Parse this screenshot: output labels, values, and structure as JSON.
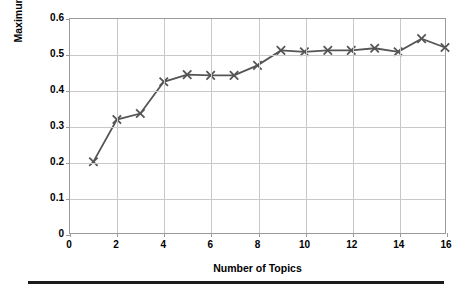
{
  "chart_data": {
    "type": "line",
    "title": "",
    "xlabel": "Number of Topics",
    "ylabel": "Maximum C_v Value",
    "x": [
      1,
      2,
      3,
      4,
      5,
      6,
      7,
      8,
      9,
      10,
      11,
      12,
      13,
      14,
      15,
      16
    ],
    "values": [
      0.2,
      0.318,
      0.335,
      0.424,
      0.444,
      0.442,
      0.442,
      0.47,
      0.512,
      0.508,
      0.512,
      0.512,
      0.518,
      0.508,
      0.545,
      0.52
    ],
    "series": [
      {
        "name": "Maximum C_v Value",
        "values": [
          0.2,
          0.318,
          0.335,
          0.424,
          0.444,
          0.442,
          0.442,
          0.47,
          0.512,
          0.508,
          0.512,
          0.512,
          0.518,
          0.508,
          0.545,
          0.52
        ]
      }
    ],
    "xlim": [
      0,
      16
    ],
    "ylim": [
      0,
      0.6
    ],
    "xticks": [
      "0",
      "2",
      "4",
      "6",
      "8",
      "10",
      "12",
      "14",
      "16"
    ],
    "xtick_values": [
      0,
      2,
      4,
      6,
      8,
      10,
      12,
      14,
      16
    ],
    "yticks": [
      "0",
      "0.1",
      "0.2",
      "0.3",
      "0.4",
      "0.5",
      "0.6"
    ],
    "ytick_values": [
      0,
      0.1,
      0.2,
      0.3,
      0.4,
      0.5,
      0.6
    ],
    "grid": true,
    "grid_axis": "both",
    "legend": null,
    "legend_position": "none",
    "marker": "x",
    "line_color": "#555555",
    "marker_color": "#555555",
    "grid_color": "#c8c8c8",
    "frame_color": "#9a9a9a",
    "background": "#ffffff"
  }
}
